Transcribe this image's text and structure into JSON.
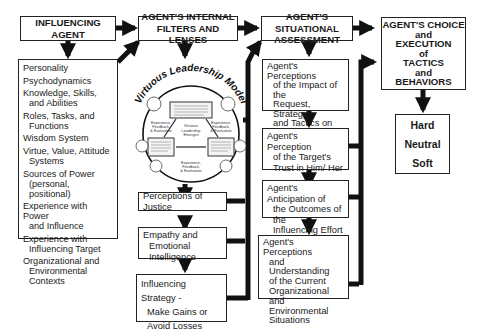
{
  "diagram": {
    "columns": [
      {
        "header": [
          "INFLUENCING",
          "AGENT"
        ],
        "items": [
          {
            "line1": "Personality"
          },
          {
            "line1": "Psychodynamics"
          },
          {
            "line1": "Knowledge, Skills,",
            "line2": "and Abilities"
          },
          {
            "line1": "Roles, Tasks, and",
            "line2": "Functions"
          },
          {
            "line1": "Wisdom System"
          },
          {
            "line1": "Virtue, Value, Attitude",
            "line2": "Systems"
          },
          {
            "line1": "Sources of Power",
            "line2": "(personal, positional)"
          },
          {
            "line1": "Experience with Power",
            "line2": "and Influence"
          },
          {
            "line1": "Experience with",
            "line2": "Influencing Target"
          },
          {
            "line1": "Organizational and",
            "line2": "Environmental Contexts"
          }
        ]
      },
      {
        "header": [
          "AGENT'S INTERNAL",
          "FILTERS AND LENSES"
        ],
        "model": {
          "title": "Virtuous Leadership Model",
          "center": [
            "Virtuous",
            "Leadership",
            "Emerges"
          ],
          "feedback_label": [
            "Experience,",
            "Feedback,",
            "& Evaluation"
          ]
        },
        "boxes": [
          {
            "lines": [
              "Perceptions of Justice"
            ]
          },
          {
            "lines": [
              "Empathy and",
              "Emotional Intelligence"
            ]
          },
          {
            "lines": [
              "Influencing Strategy -",
              "Make Gains or",
              "Avoid Losses"
            ]
          }
        ]
      },
      {
        "header": [
          "AGENT'S SITUATIONAL",
          "ASSESSMENT"
        ],
        "boxes": [
          {
            "lines": [
              "Agent's Perceptions",
              "of the Impact of the",
              "Request, Strategy,",
              "and Tactics on the",
              "Influencing Target"
            ]
          },
          {
            "lines": [
              "Agent's Perception",
              "of the Target's",
              "Trust in Him/ Her"
            ]
          },
          {
            "lines": [
              "Agent's Anticipation of",
              "the Outcomes of the",
              "Influencing Effort"
            ]
          },
          {
            "lines": [
              "Agent's Perceptions",
              "and Understanding",
              "of the Current",
              "Organizational and",
              "Environmental",
              "Situations"
            ]
          }
        ]
      },
      {
        "header": [
          "AGENT'S CHOICE",
          "and",
          "EXECUTION",
          "of",
          "TACTICS",
          "and",
          "BEHAVIORS"
        ],
        "outcomes": [
          "Hard",
          "Neutral",
          "Soft"
        ]
      }
    ],
    "colors": {
      "line": "#222222",
      "background": "#ffffff"
    }
  }
}
